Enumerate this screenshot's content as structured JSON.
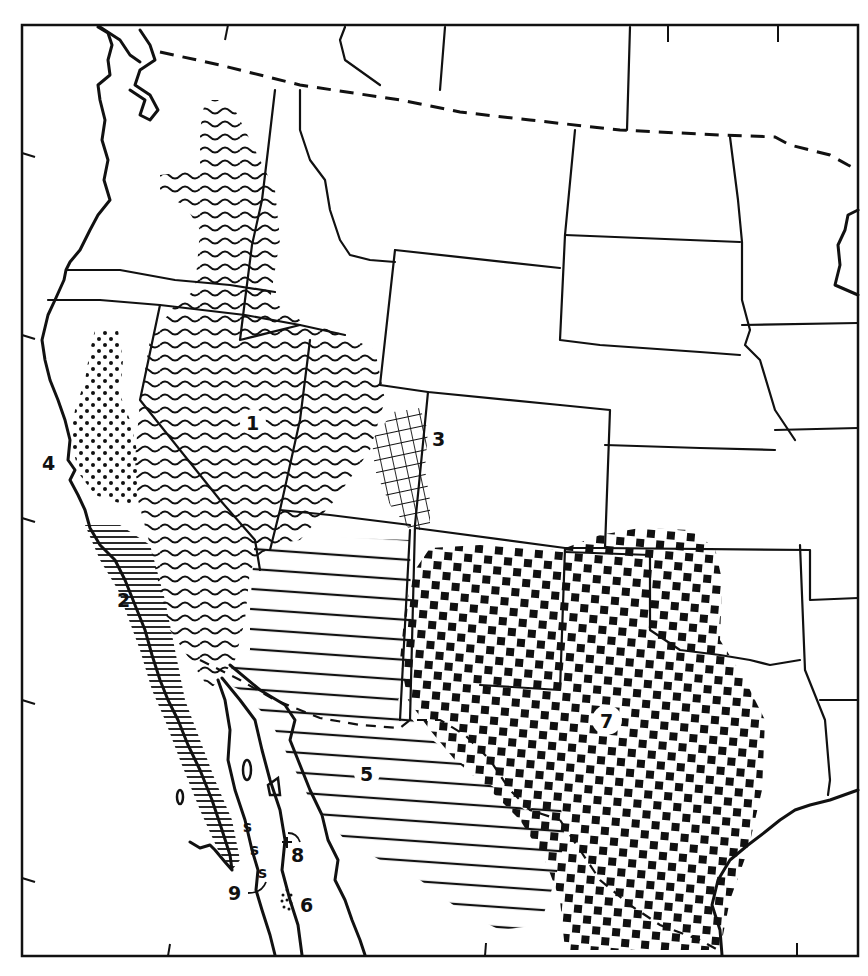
{
  "map": {
    "title": "",
    "ink_color": "#111111",
    "paper_color": "#ffffff",
    "zones": [
      {
        "id": "1",
        "label": "1",
        "pattern": "wavy-lines",
        "region": "Great Basin / Columbia Plateau"
      },
      {
        "id": "2",
        "label": "2",
        "pattern": "fine-horizontal-lines",
        "region": "Southern California coast and Baja California Pacific side"
      },
      {
        "id": "3",
        "label": "3",
        "pattern": "crosshatch-grid",
        "region": "Western Colorado Plateau"
      },
      {
        "id": "4",
        "label": "4",
        "pattern": "dots",
        "region": "Central California valley"
      },
      {
        "id": "5",
        "label": "5",
        "pattern": "wide-horizontal-lines",
        "region": "Sonoran / Mohave desert"
      },
      {
        "id": "6",
        "label": "6",
        "pattern": "dot-cluster",
        "region": "Cape region, Baja California"
      },
      {
        "id": "7",
        "label": "7",
        "pattern": "checker-squares",
        "region": "Chihuahuan desert / Southern Plains"
      },
      {
        "id": "8",
        "label": "8",
        "pattern": "cross-marker",
        "region": "Gulf island locality"
      },
      {
        "id": "9",
        "label": "9",
        "pattern": "s-symbols",
        "region": "Baja California Gulf side"
      }
    ]
  }
}
